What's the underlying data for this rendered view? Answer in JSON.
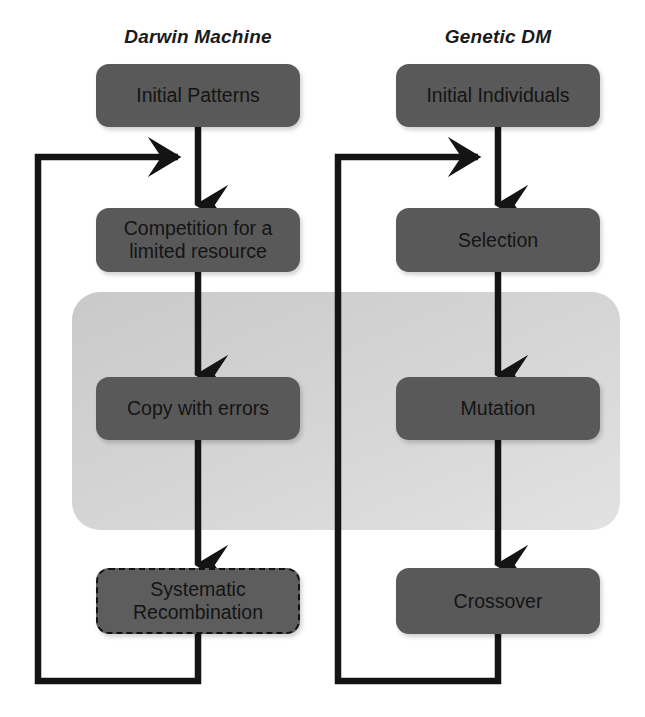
{
  "diagram": {
    "title_left": "Darwin Machine",
    "title_right": "Genetic DM",
    "colors": {
      "node_fill": "#595959",
      "panel_fill": "#d3d3d3",
      "arrow": "#141414",
      "background": "#ffffff"
    },
    "columns": [
      {
        "name": "darwin-machine",
        "header": "Darwin Machine",
        "nodes": [
          {
            "id": "initial-patterns",
            "label": "Initial Patterns",
            "style": "solid"
          },
          {
            "id": "competition-for-a-limited-resource",
            "label": "Competition for a\nlimited resource",
            "style": "solid"
          },
          {
            "id": "copy-with-errors",
            "label": "Copy with errors",
            "style": "solid"
          },
          {
            "id": "systematic-recombination",
            "label": "Systematic\nRecombination",
            "style": "dashed"
          }
        ],
        "feedback_loop": {
          "from": "systematic-recombination",
          "to": "competition-for-a-limited-resource",
          "label": ""
        }
      },
      {
        "name": "genetic-dm",
        "header": "Genetic DM",
        "nodes": [
          {
            "id": "initial-individuals",
            "label": "Initial Individuals",
            "style": "solid"
          },
          {
            "id": "selection",
            "label": "Selection",
            "style": "solid"
          },
          {
            "id": "mutation",
            "label": "Mutation",
            "style": "solid"
          },
          {
            "id": "crossover",
            "label": "Crossover",
            "style": "solid"
          }
        ],
        "feedback_loop": {
          "from": "crossover",
          "to": "selection",
          "label": ""
        }
      }
    ],
    "highlight_panel": {
      "name": "variation-stage-panel",
      "label": ""
    }
  }
}
